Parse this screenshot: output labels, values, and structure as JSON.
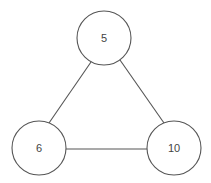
{
  "diagram": {
    "type": "undirected-graph",
    "colors": {
      "stroke": "#555555",
      "label": "#444444",
      "node_fill": "#ffffff",
      "background": "#ffffff"
    },
    "nodes": [
      {
        "id": "n5",
        "label": "5",
        "cx": 104,
        "cy": 38,
        "r": 27
      },
      {
        "id": "n6",
        "label": "6",
        "cx": 39,
        "cy": 148,
        "r": 27
      },
      {
        "id": "n10",
        "label": "10",
        "cx": 174,
        "cy": 148,
        "r": 27
      }
    ],
    "edges": [
      {
        "from": "5",
        "to": "6",
        "x1": 91,
        "y1": 62,
        "x2": 49,
        "y2": 123
      },
      {
        "from": "5",
        "to": "10",
        "x1": 120,
        "y1": 60,
        "x2": 164,
        "y2": 123
      },
      {
        "from": "6",
        "to": "10",
        "x1": 66,
        "y1": 149,
        "x2": 147,
        "y2": 149
      }
    ]
  }
}
